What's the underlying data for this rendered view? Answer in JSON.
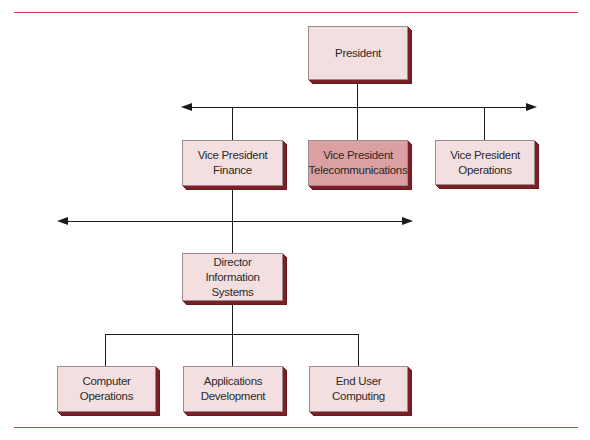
{
  "diagram": {
    "type": "org-chart",
    "colors": {
      "box_face": "#f4dfe0",
      "box_face_highlight": "#dda0a2",
      "box_shadow": "#7a1f24",
      "rule": "#c8474a",
      "connector": "#1a1a1a"
    },
    "nodes": {
      "president": {
        "line1": "President",
        "line2": ""
      },
      "vp_finance": {
        "line1": "Vice President",
        "line2": "Finance"
      },
      "vp_telecom": {
        "line1": "Vice President",
        "line2": "Telecommunications",
        "highlighted": true
      },
      "vp_operations": {
        "line1": "Vice President",
        "line2": "Operations"
      },
      "director_is": {
        "line1": "Director",
        "line2": "Information Systems"
      },
      "computer_operations": {
        "line1": "Computer",
        "line2": "Operations"
      },
      "applications_development": {
        "line1": "Applications",
        "line2": "Development"
      },
      "end_user_computing": {
        "line1": "End User",
        "line2": "Computing"
      }
    },
    "edges": [
      [
        "president",
        "vp_finance"
      ],
      [
        "president",
        "vp_telecom"
      ],
      [
        "president",
        "vp_operations"
      ],
      [
        "vp_finance",
        "director_is"
      ],
      [
        "director_is",
        "computer_operations"
      ],
      [
        "director_is",
        "applications_development"
      ],
      [
        "director_is",
        "end_user_computing"
      ]
    ]
  }
}
